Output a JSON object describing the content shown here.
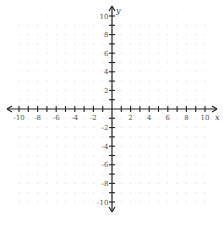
{
  "graph": {
    "title": "Coordinate plane",
    "x_axis_label": "x",
    "y_axis_label": "y",
    "x_range": [
      -10,
      10
    ],
    "y_range": [
      -10,
      10
    ],
    "tick_step": 1,
    "label_step": 2,
    "x_tick_labels": [
      "-10",
      "-8",
      "-6",
      "-4",
      "-2",
      "2",
      "4",
      "6",
      "8",
      "10"
    ],
    "y_tick_labels": [
      "10",
      "8",
      "6",
      "4",
      "2",
      "-2",
      "-4",
      "-6",
      "-8",
      "-10"
    ],
    "grid": "dotted",
    "colors": {
      "axis": "#222222",
      "grid_dot": "#d0d0d0",
      "label": "#555555"
    }
  }
}
